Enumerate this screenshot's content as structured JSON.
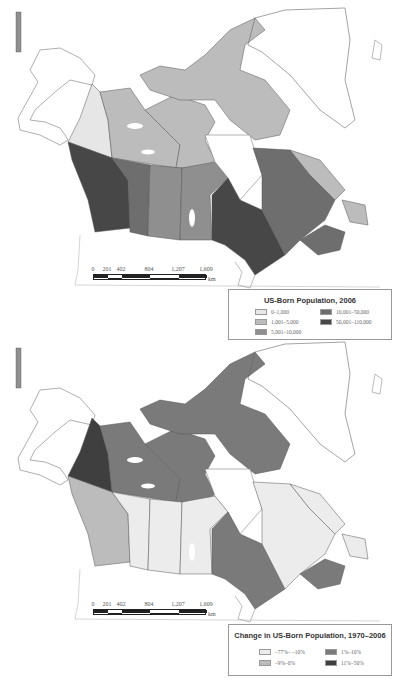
{
  "colors": {
    "c1": "#e6e6e6",
    "c2": "#bcbcbc",
    "c3": "#8f8f8f",
    "c4": "#6e6e6e",
    "c5": "#474747",
    "outline": "#555555",
    "water": "#ffffff"
  },
  "maps": [
    {
      "id": "map-2006",
      "scale_bar": {
        "ticks": [
          "0",
          "201",
          "402",
          "804",
          "1,207",
          "1,609"
        ],
        "unit": "km"
      },
      "legend": {
        "title": "US-Born Population, 2006",
        "items": [
          {
            "label": "0–1,000",
            "color": "#e6e6e6"
          },
          {
            "label": "1,001–5,000",
            "color": "#bcbcbc"
          },
          {
            "label": "5,001–10,000",
            "color": "#8f8f8f"
          },
          {
            "label": "10,001–50,000",
            "color": "#6e6e6e"
          },
          {
            "label": "50,001–110,000",
            "color": "#474747"
          }
        ]
      },
      "regions": {
        "yukon": "#e6e6e6",
        "nwt": "#bcbcbc",
        "nunavut": "#bcbcbc",
        "bc": "#474747",
        "alberta": "#6e6e6e",
        "saskatchewan": "#8f8f8f",
        "manitoba": "#8f8f8f",
        "ontario": "#474747",
        "quebec": "#6e6e6e",
        "labrador": "#bcbcbc",
        "newfoundland": "#bcbcbc",
        "maritimes": "#6e6e6e"
      }
    },
    {
      "id": "map-change",
      "scale_bar": {
        "ticks": [
          "0",
          "201",
          "402",
          "804",
          "1,207",
          "1,609"
        ],
        "unit": "km"
      },
      "legend": {
        "title": "Change in US-Born Population, 1970–2006",
        "items": [
          {
            "label": "–77%– –10%",
            "color": "#ececec"
          },
          {
            "label": "–9%–0%",
            "color": "#bcbcbc"
          },
          {
            "label": "1%–10%",
            "color": "#7a7a7a"
          },
          {
            "label": "11%–50%",
            "color": "#3f3f3f"
          }
        ]
      },
      "regions": {
        "yukon": "#3f3f3f",
        "nwt": "#7a7a7a",
        "nunavut": "#7a7a7a",
        "bc": "#bcbcbc",
        "alberta": "#ececec",
        "saskatchewan": "#ececec",
        "manitoba": "#ececec",
        "ontario": "#7a7a7a",
        "quebec": "#ececec",
        "labrador": "#ececec",
        "newfoundland": "#ececec",
        "maritimes": "#7a7a7a"
      }
    }
  ]
}
